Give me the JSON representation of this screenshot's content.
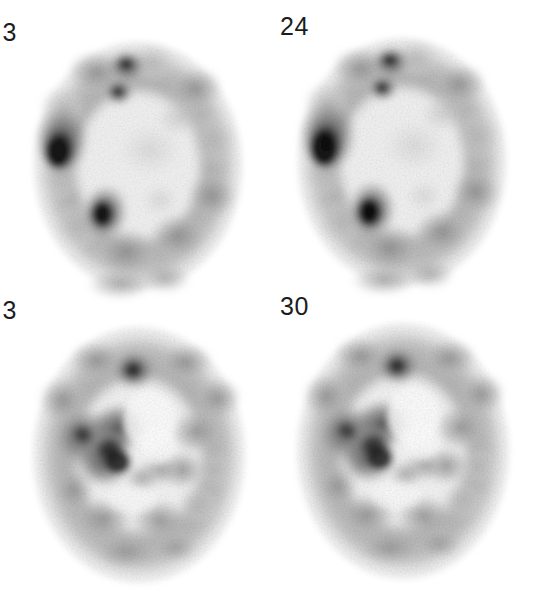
{
  "figure": {
    "kind": "nuclear-medicine-brain-montage",
    "modality": "SPECT perfusion / PET axial slices",
    "colormap": "inverted-grayscale",
    "colormap_note": "dark = high tracer uptake, white = background",
    "background_color": "#ffffff",
    "label_color": "#1c1c1c",
    "rows": 2,
    "columns": 2,
    "width": 546,
    "height": 601
  },
  "panels": [
    {
      "id": "panel-top-left",
      "slice_label": "3",
      "label_clipped": true,
      "label_note": "digit clipped at left image edge",
      "level": "superior axial slice",
      "hotspots": 3,
      "hotspot_description": "intense focal uptake in left frontal and left temporal regions plus anterior midline focus"
    },
    {
      "id": "panel-top-right",
      "slice_label": "24",
      "label_clipped": false,
      "level": "superior axial slice",
      "hotspots": 3,
      "hotspot_description": "intense focal uptake in left frontal and left temporal regions plus anterior midline focus"
    },
    {
      "id": "panel-bottom-left",
      "slice_label": "3",
      "label_clipped": true,
      "label_note": "digit clipped at left image edge",
      "level": "inferior axial slice at basal ganglia / ventricle level",
      "hotspots": 2,
      "hotspot_description": "confluent uptake in left basal ganglia region and anterior midline focus"
    },
    {
      "id": "panel-bottom-right",
      "slice_label": "30",
      "label_clipped": false,
      "level": "inferior axial slice at basal ganglia / ventricle level",
      "hotspots": 2,
      "hotspot_description": "confluent uptake in left basal ganglia region and anterior midline focus"
    }
  ],
  "geometry": {
    "label_positions": [
      {
        "id": "panel-top-left",
        "x": 14,
        "y": 20
      },
      {
        "id": "panel-top-right",
        "x": 280,
        "y": 14
      },
      {
        "id": "panel-bottom-left",
        "x": 14,
        "y": 298
      },
      {
        "id": "panel-bottom-right",
        "x": 280,
        "y": 294
      }
    ],
    "brain_boxes": [
      {
        "id": "panel-top-left",
        "x": 28,
        "y": 40,
        "width": 220,
        "height": 252
      },
      {
        "id": "panel-top-right",
        "x": 292,
        "y": 36,
        "width": 220,
        "height": 252
      },
      {
        "id": "panel-bottom-left",
        "x": 28,
        "y": 326,
        "width": 222,
        "height": 258
      },
      {
        "id": "panel-bottom-right",
        "x": 292,
        "y": 322,
        "width": 222,
        "height": 258
      }
    ]
  },
  "intensity_scale": {
    "background": "#ffffff",
    "low_uptake": "#e8e8e8",
    "mid_uptake": "#a8a8a8",
    "high_uptake": "#5a5a5a",
    "peak_uptake": "#1a1a1a"
  }
}
